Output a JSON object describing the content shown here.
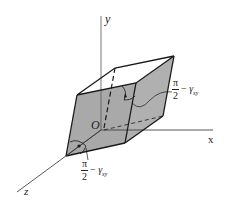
{
  "diagram": {
    "title": "",
    "axes": {
      "x_label": "x",
      "y_label": "y",
      "z_label": "z",
      "origin_label": "O"
    },
    "angle_labels": [
      {
        "numerator": "π",
        "denominator": "2",
        "minus": "−",
        "symbol": "γ",
        "subscript": "xy",
        "position": "right"
      },
      {
        "numerator": "π",
        "denominator": "2",
        "minus": "−",
        "symbol": "γ",
        "subscript": "xy",
        "position": "bottom"
      }
    ],
    "colors": {
      "face_fill": "#a8a8a8",
      "line": "#1a1a1a",
      "background": "#ffffff"
    }
  }
}
